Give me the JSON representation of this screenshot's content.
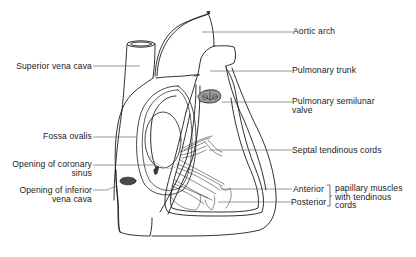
{
  "diagram": {
    "colors": {
      "line": "#1a1a1a",
      "leader": "#555555",
      "background": "#ffffff",
      "valve_fill": "#6a6a6a"
    },
    "labels_left": [
      {
        "id": "superior-vena-cava",
        "lines": [
          "Superior vena cava"
        ]
      },
      {
        "id": "fossa-ovalis",
        "lines": [
          "Fossa ovalis"
        ]
      },
      {
        "id": "opening-coronary-sinus",
        "lines": [
          "Opening of coronary",
          "sinus"
        ]
      },
      {
        "id": "opening-inferior-vena-cava",
        "lines": [
          "Opening of inferior",
          "vena cava"
        ]
      }
    ],
    "labels_right": [
      {
        "id": "aortic-arch",
        "lines": [
          "Aortic arch"
        ]
      },
      {
        "id": "pulmonary-trunk",
        "lines": [
          "Pulmonary trunk"
        ]
      },
      {
        "id": "pulmonary-semilunar-valve",
        "lines": [
          "Pulmonary semilunar",
          "valve"
        ]
      },
      {
        "id": "septal-tendinous-cords",
        "lines": [
          "Septal tendinous cords"
        ]
      },
      {
        "id": "anterior",
        "lines": [
          "Anterior"
        ]
      },
      {
        "id": "posterior",
        "lines": [
          "Posterior"
        ]
      }
    ],
    "bracket_group": {
      "members": [
        "Anterior",
        "Posterior"
      ],
      "lines": [
        "papillary muscles",
        "with tendinous",
        "cords"
      ]
    }
  }
}
